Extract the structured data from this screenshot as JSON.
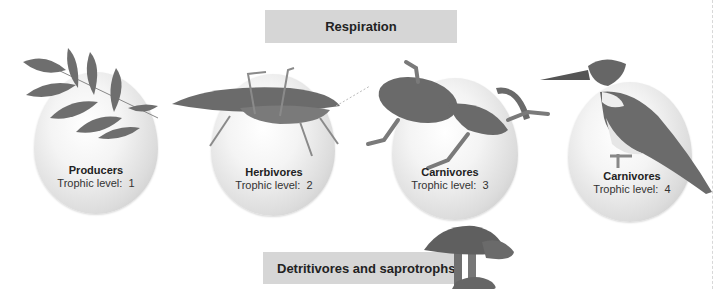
{
  "diagram": {
    "title_top": "Respiration",
    "title_bottom": "Detritivores and saprotrophs",
    "levels": [
      {
        "group": "Producers",
        "trophic_label": "Trophic level:",
        "level": "1",
        "organism": "leaves"
      },
      {
        "group": "Herbivores",
        "trophic_label": "Trophic level:",
        "level": "2",
        "organism": "katydid"
      },
      {
        "group": "Carnivores",
        "trophic_label": "Trophic level:",
        "level": "3",
        "organism": "frog"
      },
      {
        "group": "Carnivores",
        "trophic_label": "Trophic level:",
        "level": "4",
        "organism": "kingfisher"
      }
    ],
    "colors": {
      "box_fill": "#d6d6d6",
      "organism_gray": "#6b6b6b"
    }
  }
}
